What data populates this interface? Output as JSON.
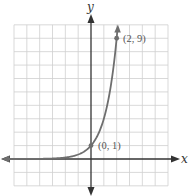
{
  "chart_data": {
    "type": "line",
    "title": "",
    "xlabel": "x",
    "ylabel": "y",
    "function": "y = 3^x",
    "xlim": [
      -6,
      6
    ],
    "ylim": [
      -2,
      10
    ],
    "grid": true,
    "x_tick_labels": [],
    "y_tick_labels": [],
    "series": [
      {
        "name": "exponential curve",
        "x": [
          -6,
          -5,
          -4,
          -3,
          -2,
          -1,
          0,
          1,
          2,
          2.1
        ],
        "y": [
          0.0014,
          0.0041,
          0.0123,
          0.037,
          0.111,
          0.333,
          1,
          3,
          9,
          10.04
        ]
      }
    ],
    "annotations": [
      {
        "x": 0,
        "y": 1,
        "label": "(0, 1)"
      },
      {
        "x": 2,
        "y": 9,
        "label": "(2, 9)"
      }
    ]
  },
  "labels": {
    "x_axis": "x",
    "y_axis": "y",
    "point_a": "(0, 1)",
    "point_b": "(2, 9)"
  },
  "colors": {
    "grid": "#cfcfcf",
    "axis": "#333333",
    "curve": "#6e6e6e",
    "point": "#6e6e6e",
    "label": "#555555"
  }
}
